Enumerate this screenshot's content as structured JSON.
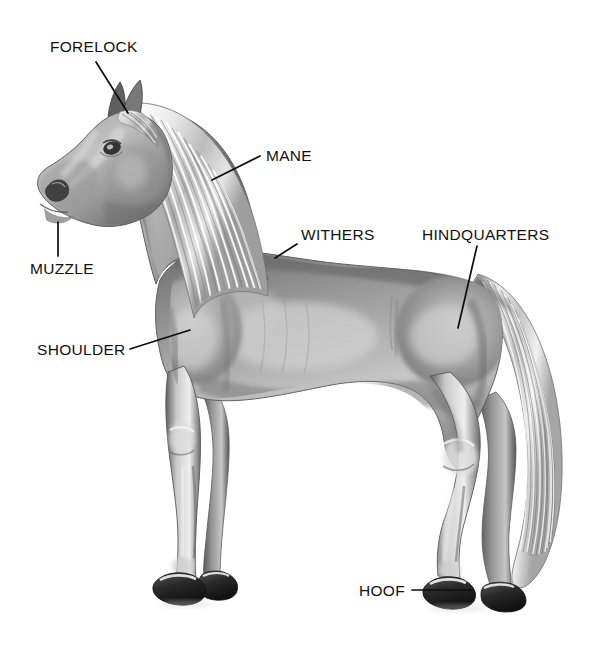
{
  "figure": {
    "style": "pencil-illustration",
    "background_color": "#ffffff",
    "ink_color": "#111111",
    "width": 605,
    "height": 646
  },
  "labels": [
    {
      "id": "forelock",
      "text": "FORELOCK",
      "text_x": 50,
      "text_y": 52,
      "anchor": "start",
      "leader": "M 96,62 L 128,113",
      "target_x": 128,
      "target_y": 113
    },
    {
      "id": "mane",
      "text": "MANE",
      "text_x": 266,
      "text_y": 161,
      "anchor": "start",
      "leader": "M 260,156 L 212,180",
      "target_x": 212,
      "target_y": 180
    },
    {
      "id": "muzzle",
      "text": "MUZZLE",
      "text_x": 30,
      "text_y": 274,
      "anchor": "start",
      "leader": "M 58,256 L 58,222",
      "target_x": 58,
      "target_y": 222
    },
    {
      "id": "withers",
      "text": "WITHERS",
      "text_x": 301,
      "text_y": 240,
      "anchor": "start",
      "leader": "M 297,244 L 275,258",
      "target_x": 275,
      "target_y": 258
    },
    {
      "id": "hindquarters",
      "text": "HINDQUARTERS",
      "text_x": 422,
      "text_y": 240,
      "anchor": "start",
      "leader": "M 477,246 L 458,328",
      "target_x": 458,
      "target_y": 328
    },
    {
      "id": "shoulder",
      "text": "SHOULDER",
      "text_x": 37,
      "text_y": 355,
      "anchor": "start",
      "leader": "M 130,349 L 190,330",
      "target_x": 190,
      "target_y": 330
    },
    {
      "id": "hoof",
      "text": "HOOF",
      "text_x": 359,
      "text_y": 596,
      "anchor": "start",
      "leader": "M 412,590 L 472,590",
      "target_x": 472,
      "target_y": 590
    }
  ]
}
